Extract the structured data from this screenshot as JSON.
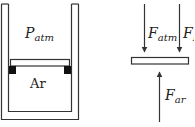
{
  "diagram": {
    "cylinder": {
      "gas_above_label": {
        "main": "P",
        "sub": "atm"
      },
      "gas_below_label": "Ar"
    },
    "free_body": {
      "forces": [
        {
          "name": "atmospheric-force",
          "main": "F",
          "sub": "atm",
          "direction": "down"
        },
        {
          "name": "piston-weight-force",
          "main": "F",
          "sub": "P",
          "direction": "down"
        },
        {
          "name": "argon-force",
          "main": "F",
          "sub": "ar",
          "direction": "up"
        }
      ]
    },
    "colors": {
      "stroke": "#333333",
      "stop_blocks": "#111111",
      "background": "#ffffff"
    }
  }
}
